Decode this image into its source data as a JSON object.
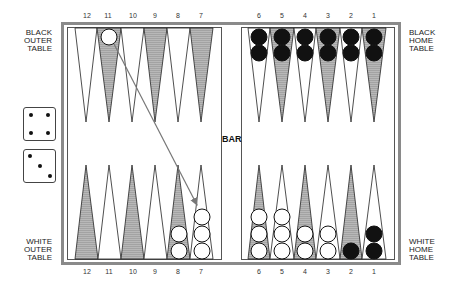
{
  "labels": {
    "black_outer": [
      "BLACK",
      "OUTER",
      "TABLE"
    ],
    "black_home": [
      "BLACK",
      "HOME",
      "TABLE"
    ],
    "white_outer": [
      "WHITE",
      "OUTER",
      "TABLE"
    ],
    "white_home": [
      "WHITE",
      "HOME",
      "TABLE"
    ],
    "bar": "BAR"
  },
  "point_numbers": {
    "left": [
      "12",
      "11",
      "10",
      "9",
      "8",
      "7"
    ],
    "right": [
      "6",
      "5",
      "4",
      "3",
      "2",
      "1"
    ]
  },
  "dice": [
    {
      "value": 4
    },
    {
      "value": 3
    }
  ],
  "colors": {
    "frame": "#8a8a8a",
    "shaded_point": "#a8a8a8",
    "black_checker": "#111111",
    "white_checker": "#ffffff",
    "arrow": "#777777"
  },
  "checkers": {
    "top": [
      {
        "point": "11",
        "color": "white",
        "count": 1
      },
      {
        "point": "6",
        "color": "black",
        "count": 2
      },
      {
        "point": "5",
        "color": "black",
        "count": 2
      },
      {
        "point": "4",
        "color": "black",
        "count": 2
      },
      {
        "point": "3",
        "color": "black",
        "count": 2
      },
      {
        "point": "2",
        "color": "black",
        "count": 2
      },
      {
        "point": "1",
        "color": "black",
        "count": 2
      }
    ],
    "bottom": [
      {
        "point": "8",
        "color": "white",
        "count": 2
      },
      {
        "point": "7",
        "color": "white",
        "count": 3
      },
      {
        "point": "6",
        "color": "white",
        "count": 3
      },
      {
        "point": "5",
        "color": "white",
        "count": 3
      },
      {
        "point": "4",
        "color": "white",
        "count": 2
      },
      {
        "point": "3",
        "color": "white",
        "count": 2
      },
      {
        "point": "2",
        "color": "black",
        "count": 1
      },
      {
        "point": "1",
        "color": "black",
        "count": 2
      }
    ]
  },
  "move_arrow": {
    "from": "top-11",
    "to": "bottom-7"
  }
}
